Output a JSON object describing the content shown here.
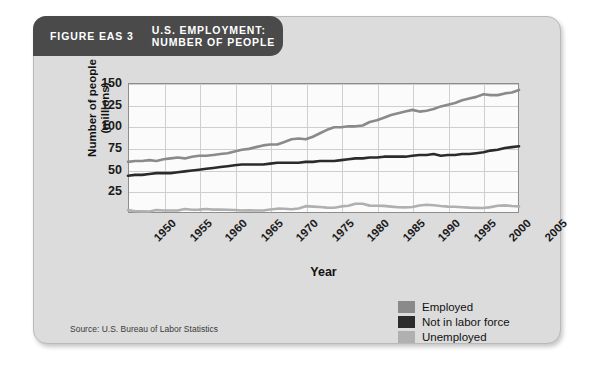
{
  "figure": {
    "number": "FIGURE EAS 3",
    "title": "U.S. EMPLOYMENT:\nNUMBER OF PEOPLE",
    "source": "Source: U.S. Bureau of Labor Statistics"
  },
  "axes": {
    "ylabel": "Number of people\n(millions)",
    "xlabel": "Year",
    "yticks": [
      "150",
      "125",
      "100",
      "75",
      "50",
      "25"
    ],
    "xticks": [
      "1950",
      "1955",
      "1960",
      "1965",
      "1970",
      "1975",
      "1980",
      "1985",
      "1990",
      "1995",
      "2000",
      "2005"
    ]
  },
  "legend": {
    "items": [
      {
        "label": "Employed",
        "color": "#8a8a8a"
      },
      {
        "label": "Not in labor force",
        "color": "#2b2b2b"
      },
      {
        "label": "Unemployed",
        "color": "#b0b0b0"
      }
    ]
  },
  "colors": {
    "card_background": "#dcdcdc",
    "header_tab": "#4a4a4a",
    "plot_background": "#fbfbfb",
    "gridline": "#cfcfcf",
    "axis": "#8d8d8d"
  },
  "chart_data": {
    "type": "line",
    "title": "U.S. EMPLOYMENT: NUMBER OF PEOPLE",
    "xlabel": "Year",
    "ylabel": "Number of people (millions)",
    "xlim": [
      1950,
      2005
    ],
    "ylim": [
      0,
      150
    ],
    "yticks": [
      25,
      50,
      75,
      100,
      125,
      150
    ],
    "xticks": [
      1950,
      1955,
      1960,
      1965,
      1970,
      1975,
      1980,
      1985,
      1990,
      1995,
      2000,
      2005
    ],
    "grid": true,
    "legend_position": "bottom-right",
    "x": [
      1950,
      1951,
      1952,
      1953,
      1954,
      1955,
      1956,
      1957,
      1958,
      1959,
      1960,
      1961,
      1962,
      1963,
      1964,
      1965,
      1966,
      1967,
      1968,
      1969,
      1970,
      1971,
      1972,
      1973,
      1974,
      1975,
      1976,
      1977,
      1978,
      1979,
      1980,
      1981,
      1982,
      1983,
      1984,
      1985,
      1986,
      1987,
      1988,
      1989,
      1990,
      1991,
      1992,
      1993,
      1994,
      1995,
      1996,
      1997,
      1998,
      1999,
      2000,
      2001,
      2002,
      2003,
      2004,
      2005
    ],
    "series": [
      {
        "name": "Employed",
        "color": "#8a8a8a",
        "values": [
          59,
          60,
          60,
          61,
          60,
          62,
          63,
          64,
          63,
          65,
          66,
          66,
          67,
          68,
          69,
          71,
          73,
          74,
          76,
          78,
          79,
          79,
          82,
          85,
          86,
          85,
          88,
          92,
          96,
          99,
          99,
          100,
          100,
          101,
          105,
          107,
          110,
          113,
          115,
          117,
          119,
          117,
          118,
          120,
          123,
          125,
          127,
          130,
          132,
          134,
          137,
          136,
          136,
          138,
          139,
          142
        ]
      },
      {
        "name": "Not in labor force",
        "color": "#2b2b2b",
        "values": [
          43,
          44,
          44,
          45,
          46,
          46,
          46,
          47,
          48,
          49,
          50,
          51,
          52,
          53,
          54,
          55,
          56,
          56,
          56,
          56,
          57,
          58,
          58,
          58,
          58,
          59,
          59,
          60,
          60,
          60,
          61,
          62,
          63,
          63,
          64,
          64,
          65,
          65,
          65,
          65,
          66,
          67,
          67,
          68,
          66,
          67,
          67,
          68,
          68,
          69,
          70,
          72,
          73,
          75,
          76,
          77
        ]
      },
      {
        "name": "Unemployed",
        "color": "#b0b0b0",
        "values": [
          3.3,
          2.1,
          1.9,
          1.8,
          3.5,
          2.9,
          2.8,
          2.9,
          4.6,
          3.7,
          3.9,
          4.7,
          3.9,
          4.1,
          3.8,
          3.4,
          2.9,
          3.0,
          2.8,
          2.8,
          4.1,
          5.0,
          4.9,
          4.4,
          5.2,
          7.9,
          7.4,
          7.0,
          6.2,
          6.1,
          7.6,
          8.3,
          10.7,
          10.7,
          8.5,
          8.3,
          8.2,
          7.4,
          6.7,
          6.5,
          7.0,
          8.6,
          9.6,
          8.9,
          8.0,
          7.4,
          7.2,
          6.7,
          6.2,
          5.9,
          5.7,
          6.8,
          8.4,
          8.8,
          8.1,
          7.6
        ]
      }
    ]
  }
}
